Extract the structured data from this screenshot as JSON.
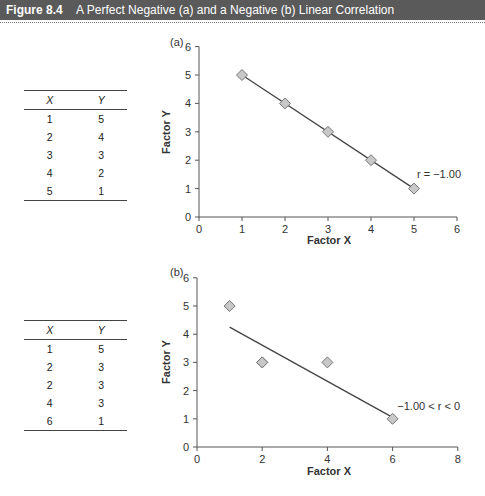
{
  "header": {
    "figure_label": "Figure 8.4",
    "caption": "A Perfect Negative (a) and a Negative (b) Linear Correlation"
  },
  "tables": [
    {
      "columns": [
        "X",
        "Y"
      ],
      "rows": [
        [
          "1",
          "5"
        ],
        [
          "2",
          "4"
        ],
        [
          "3",
          "3"
        ],
        [
          "4",
          "2"
        ],
        [
          "5",
          "1"
        ]
      ]
    },
    {
      "columns": [
        "X",
        "Y"
      ],
      "rows": [
        [
          "1",
          "5"
        ],
        [
          "2",
          "3"
        ],
        [
          "2",
          "3"
        ],
        [
          "4",
          "3"
        ],
        [
          "6",
          "1"
        ]
      ]
    }
  ],
  "chart_data": [
    {
      "type": "scatter",
      "panel_label": "(a)",
      "title": "",
      "xlabel": "Factor X",
      "ylabel": "Factor Y",
      "xlim": [
        0,
        6
      ],
      "ylim": [
        0,
        6
      ],
      "xticks": [
        0,
        1,
        2,
        3,
        4,
        5,
        6
      ],
      "yticks": [
        0,
        1,
        2,
        3,
        4,
        5,
        6
      ],
      "points": [
        {
          "x": 1,
          "y": 5
        },
        {
          "x": 2,
          "y": 4
        },
        {
          "x": 3,
          "y": 3
        },
        {
          "x": 4,
          "y": 2
        },
        {
          "x": 5,
          "y": 1
        }
      ],
      "fit_line": {
        "x1": 1,
        "y1": 5,
        "x2": 5,
        "y2": 1
      },
      "annotation": "r = −1.00",
      "grid": false
    },
    {
      "type": "scatter",
      "panel_label": "(b)",
      "title": "",
      "xlabel": "Factor X",
      "ylabel": "Factor Y",
      "xlim": [
        0,
        8
      ],
      "ylim": [
        0,
        6
      ],
      "xticks": [
        0,
        2,
        4,
        6,
        8
      ],
      "yticks": [
        0,
        1,
        2,
        3,
        4,
        5,
        6
      ],
      "points": [
        {
          "x": 1,
          "y": 5
        },
        {
          "x": 2,
          "y": 3
        },
        {
          "x": 2,
          "y": 3
        },
        {
          "x": 4,
          "y": 3
        },
        {
          "x": 6,
          "y": 1
        }
      ],
      "fit_line": {
        "x1": 1,
        "y1": 4.25,
        "x2": 6,
        "y2": 1.05
      },
      "annotation": "−1.00 < r < 0",
      "grid": false
    }
  ],
  "colors": {
    "header_bg": "#5a5a5a",
    "marker_fill": "#c8c8c8",
    "marker_stroke": "#777777",
    "line": "#444444"
  }
}
